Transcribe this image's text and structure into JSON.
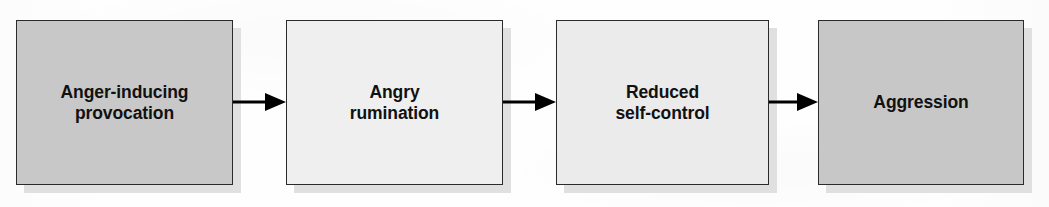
{
  "diagram": {
    "type": "flowchart",
    "orientation": "left-to-right",
    "canvas": {
      "width": 1049,
      "height": 207,
      "background_color": "#ffffff"
    },
    "style": {
      "node_border_color": "#2b2b2b",
      "node_shadow_color": "#e0e0e0",
      "arrow_color": "#000000",
      "text_color": "#111111"
    },
    "nodes": [
      {
        "id": "provocation",
        "label": "Anger-inducing\nprovocation",
        "fill_color": "#c8c8c8",
        "x": 16,
        "y": 20,
        "width": 217,
        "height": 165
      },
      {
        "id": "rumination",
        "label": "Angry\nrumination",
        "fill_color": "#efefef",
        "x": 286,
        "y": 20,
        "width": 217,
        "height": 165
      },
      {
        "id": "self-control",
        "label": "Reduced\nself-control",
        "fill_color": "#ebebeb",
        "x": 556,
        "y": 20,
        "width": 213,
        "height": 165
      },
      {
        "id": "aggression",
        "label": "Aggression",
        "fill_color": "#c7c7c7",
        "x": 818,
        "y": 20,
        "width": 206,
        "height": 165
      }
    ],
    "arrows": [
      {
        "id": "arrow-1",
        "from": "provocation",
        "to": "rumination",
        "x": 233,
        "y": 91,
        "width": 53
      },
      {
        "id": "arrow-2",
        "from": "rumination",
        "to": "self-control",
        "x": 503,
        "y": 91,
        "width": 53
      },
      {
        "id": "arrow-3",
        "from": "self-control",
        "to": "aggression",
        "x": 769,
        "y": 91,
        "width": 49
      }
    ],
    "ghost_artifacts": [
      {
        "text": "and how to describe",
        "x": 318,
        "y": 44
      },
      {
        "text": "a brief look at the",
        "x": 588,
        "y": 40
      },
      {
        "text": "process of control",
        "x": 576,
        "y": 86
      },
      {
        "text": "the research shift",
        "x": 312,
        "y": 126
      },
      {
        "text": "in moments when",
        "x": 600,
        "y": 128
      }
    ]
  }
}
